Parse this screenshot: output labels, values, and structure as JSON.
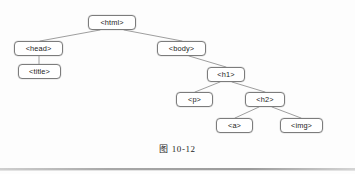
{
  "figure": {
    "caption": "图 10-12",
    "type": "dom-tree-diagram",
    "background_color": "#ffffff",
    "node_border_color": "#7c7c7c",
    "edge_color": "#8d8d8d",
    "text_color": "#1b1b1b"
  },
  "tree": {
    "nodes": [
      {
        "id": "html",
        "label": "<html>",
        "x": 88,
        "y": 15,
        "w": 48,
        "h": 15
      },
      {
        "id": "head",
        "label": "<head>",
        "x": 14,
        "y": 41,
        "w": 49,
        "h": 15
      },
      {
        "id": "body",
        "label": "<body>",
        "x": 157,
        "y": 41,
        "w": 49,
        "h": 15
      },
      {
        "id": "title",
        "label": "<title>",
        "x": 18,
        "y": 64,
        "w": 43,
        "h": 15
      },
      {
        "id": "h1",
        "label": "<h1>",
        "x": 207,
        "y": 67,
        "w": 38,
        "h": 15
      },
      {
        "id": "p",
        "label": "<p>",
        "x": 176,
        "y": 92,
        "w": 37,
        "h": 15
      },
      {
        "id": "h2",
        "label": "<h2>",
        "x": 245,
        "y": 92,
        "w": 40,
        "h": 15
      },
      {
        "id": "a",
        "label": "<a>",
        "x": 216,
        "y": 118,
        "w": 37,
        "h": 15
      },
      {
        "id": "img",
        "label": "<img>",
        "x": 280,
        "y": 118,
        "w": 43,
        "h": 15
      }
    ],
    "edges": [
      {
        "from": "html",
        "to": "head",
        "x1": 100,
        "y1": 30,
        "x2": 40,
        "y2": 41
      },
      {
        "from": "html",
        "to": "body",
        "x1": 124,
        "y1": 30,
        "x2": 182,
        "y2": 41
      },
      {
        "from": "head",
        "to": "title",
        "x1": 39,
        "y1": 56,
        "x2": 39,
        "y2": 64
      },
      {
        "from": "body",
        "to": "h1",
        "x1": 189,
        "y1": 56,
        "x2": 226,
        "y2": 67
      },
      {
        "from": "h1",
        "to": "p",
        "x1": 220,
        "y1": 82,
        "x2": 195,
        "y2": 92
      },
      {
        "from": "h1",
        "to": "h2",
        "x1": 232,
        "y1": 82,
        "x2": 265,
        "y2": 92
      },
      {
        "from": "h2",
        "to": "a",
        "x1": 259,
        "y1": 107,
        "x2": 235,
        "y2": 118
      },
      {
        "from": "h2",
        "to": "img",
        "x1": 272,
        "y1": 107,
        "x2": 301,
        "y2": 118
      }
    ]
  }
}
